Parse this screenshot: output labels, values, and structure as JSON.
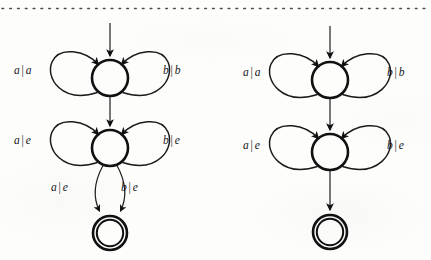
{
  "page": {
    "background_color": "#fdfdfc",
    "ink_color": "#111111",
    "top_rule": "dotted-rule"
  },
  "figure": {
    "type": "finite-state-transducer-diagrams",
    "diagram_count": 2,
    "diagrams": [
      {
        "id": "left-transducer",
        "states": [
          {
            "id": "q0",
            "kind": "state",
            "cx": 110,
            "cy": 78,
            "r": 18
          },
          {
            "id": "q1",
            "kind": "state",
            "cx": 110,
            "cy": 148,
            "r": 18
          },
          {
            "id": "q2",
            "kind": "accepting-state",
            "cx": 110,
            "cy": 233,
            "r_outer": 17,
            "r_inner": 13
          }
        ],
        "start_arrow": {
          "from_state": null,
          "to_state": "q0"
        },
        "transitions": [
          {
            "id": "q0-self-left",
            "from": "q0",
            "to": "q0",
            "input": "a",
            "output": "a",
            "side": "left"
          },
          {
            "id": "q0-self-right",
            "from": "q0",
            "to": "q0",
            "input": "b",
            "output": "b",
            "side": "right"
          },
          {
            "id": "q0-q1",
            "from": "q0",
            "to": "q1",
            "input": "",
            "output": "",
            "side": "down"
          },
          {
            "id": "q1-self-left",
            "from": "q1",
            "to": "q1",
            "input": "a",
            "output": "e",
            "side": "left"
          },
          {
            "id": "q1-self-right",
            "from": "q1",
            "to": "q1",
            "input": "b",
            "output": "e",
            "side": "right"
          },
          {
            "id": "q1-q2-left",
            "from": "q1",
            "to": "q2",
            "input": "a",
            "output": "e",
            "side": "down-left"
          },
          {
            "id": "q1-q2-right",
            "from": "q1",
            "to": "q2",
            "input": "b",
            "output": "e",
            "side": "down-right"
          }
        ],
        "labels": [
          {
            "id": "left-l1",
            "input": "a",
            "sep": "|",
            "output": "a",
            "x": 14,
            "y": 65
          },
          {
            "id": "left-l2",
            "input": "b",
            "sep": "|",
            "output": "b",
            "x": 163,
            "y": 65
          },
          {
            "id": "left-l3",
            "input": "a",
            "sep": "|",
            "output": "e",
            "x": 14,
            "y": 135
          },
          {
            "id": "left-l4",
            "input": "b",
            "sep": "|",
            "output": "e",
            "x": 163,
            "y": 135
          },
          {
            "id": "left-l5",
            "input": "a",
            "sep": "|",
            "output": "e",
            "x": 51,
            "y": 182
          },
          {
            "id": "left-l6",
            "input": "b",
            "sep": "|",
            "output": "e",
            "x": 121,
            "y": 182
          }
        ]
      },
      {
        "id": "right-transducer",
        "states": [
          {
            "id": "p0",
            "kind": "state",
            "cx": 330,
            "cy": 80,
            "r": 18
          },
          {
            "id": "p1",
            "kind": "state",
            "cx": 330,
            "cy": 152,
            "r": 18
          },
          {
            "id": "p2",
            "kind": "accepting-state",
            "cx": 330,
            "cy": 232,
            "r_outer": 17,
            "r_inner": 13
          }
        ],
        "start_arrow": {
          "from_state": null,
          "to_state": "p0"
        },
        "transitions": [
          {
            "id": "p0-self-left",
            "from": "p0",
            "to": "p0",
            "input": "a",
            "output": "a",
            "side": "left"
          },
          {
            "id": "p0-self-right",
            "from": "p0",
            "to": "p0",
            "input": "b",
            "output": "b",
            "side": "right"
          },
          {
            "id": "p0-p1",
            "from": "p0",
            "to": "p1",
            "input": "",
            "output": "",
            "side": "down"
          },
          {
            "id": "p1-self-left",
            "from": "p1",
            "to": "p1",
            "input": "a",
            "output": "e",
            "side": "left"
          },
          {
            "id": "p1-self-right",
            "from": "p1",
            "to": "p1",
            "input": "b",
            "output": "e",
            "side": "right"
          },
          {
            "id": "p1-p2",
            "from": "p1",
            "to": "p2",
            "input": "",
            "output": "",
            "side": "down"
          }
        ],
        "labels": [
          {
            "id": "right-l1",
            "input": "a",
            "sep": "|",
            "output": "a",
            "x": 243,
            "y": 67
          },
          {
            "id": "right-l2",
            "input": "b",
            "sep": "|",
            "output": "b",
            "x": 387,
            "y": 67
          },
          {
            "id": "right-l3",
            "input": "a",
            "sep": "|",
            "output": "e",
            "x": 243,
            "y": 140
          },
          {
            "id": "right-l4",
            "input": "b",
            "sep": "|",
            "output": "e",
            "x": 387,
            "y": 140
          }
        ]
      }
    ]
  }
}
